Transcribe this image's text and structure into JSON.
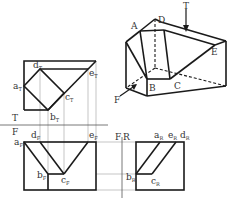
{
  "figure": {
    "type": "orthographic-projection",
    "colors": {
      "line": "#1a1a1a",
      "projector": "#888888",
      "text": "#333333",
      "background": "#ffffff"
    }
  },
  "isometric": {
    "labels": {
      "A": "A",
      "B": "B",
      "C": "C",
      "D": "D",
      "E": "E",
      "T": "T",
      "F": "F"
    }
  },
  "fold_lines": {
    "top_front": {
      "upper": "T",
      "lower": "F"
    },
    "front_right": {
      "label_left": "F",
      "label_right": "R"
    }
  },
  "top_view": {
    "labels": {
      "a": {
        "main": "a",
        "sub": "T"
      },
      "b": {
        "main": "b",
        "sub": "T"
      },
      "c": {
        "main": "c",
        "sub": "T"
      },
      "d": {
        "main": "d",
        "sub": "T"
      },
      "e": {
        "main": "e",
        "sub": "T"
      }
    }
  },
  "front_view": {
    "labels": {
      "a": {
        "main": "a",
        "sub": "F"
      },
      "b": {
        "main": "b",
        "sub": "F"
      },
      "c": {
        "main": "c",
        "sub": "F"
      },
      "d": {
        "main": "d",
        "sub": "F"
      },
      "e": {
        "main": "e",
        "sub": "F"
      }
    }
  },
  "right_view": {
    "labels": {
      "a": {
        "main": "a",
        "sub": "R"
      },
      "b": {
        "main": "b",
        "sub": "R"
      },
      "c": {
        "main": "c",
        "sub": "R"
      },
      "d": {
        "main": "d",
        "sub": "R"
      },
      "e": {
        "main": "e",
        "sub": "R"
      }
    }
  }
}
